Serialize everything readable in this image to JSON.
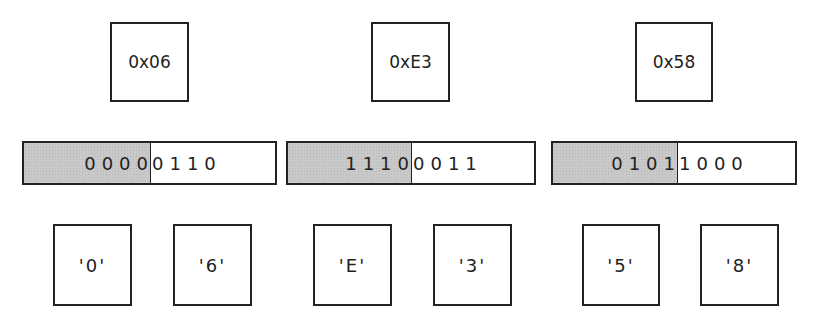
{
  "diagram": {
    "bytes": [
      {
        "hex": "0x06",
        "high_nibble": "0000",
        "low_nibble": "0110",
        "chars": [
          "'0'",
          "'6'"
        ]
      },
      {
        "hex": "0xE3",
        "high_nibble": "1110",
        "low_nibble": "0011",
        "chars": [
          "'E'",
          "'3'"
        ]
      },
      {
        "hex": "0x58",
        "high_nibble": "0101",
        "low_nibble": "1000",
        "chars": [
          "'5'",
          "'8'"
        ]
      }
    ],
    "colors": {
      "border": "#222222",
      "high_nibble_fill": "#c9c9c9",
      "background": "#ffffff"
    }
  }
}
